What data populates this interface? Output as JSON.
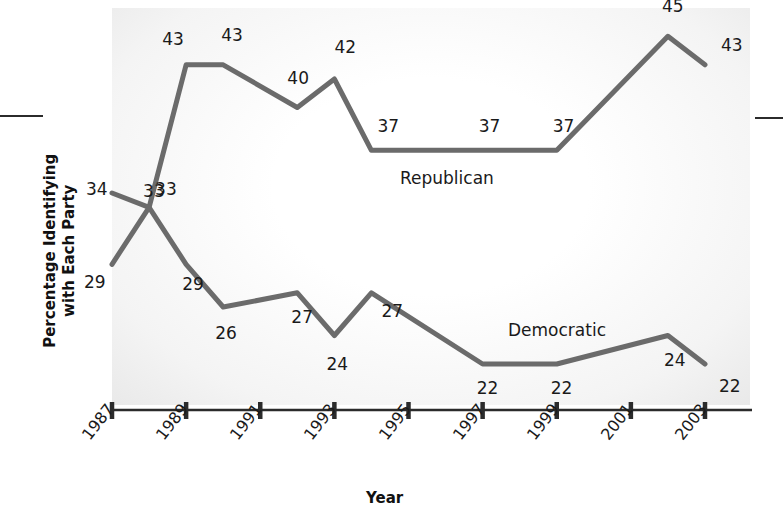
{
  "chart_data": {
    "type": "line",
    "title": "",
    "xlabel": "Year",
    "ylabel": "Percentage Identifying\nwith Each Party",
    "x": [
      1987,
      1988,
      1989,
      1990,
      1992,
      1993,
      1994,
      1997,
      1999,
      2002,
      2003
    ],
    "xtick_labels": [
      "1987",
      "1989",
      "1991",
      "1993",
      "1995",
      "1997",
      "1999",
      "2001",
      "2003"
    ],
    "xlim": [
      1987,
      2003.7
    ],
    "ylim": [
      18,
      48
    ],
    "grid": false,
    "legend_position": "inline-annotations",
    "series": [
      {
        "name": "Republican",
        "color": "#6b6b6b",
        "points": [
          {
            "x": 1987,
            "y": 34,
            "label": "34"
          },
          {
            "x": 1988,
            "y": 33,
            "label": "33"
          },
          {
            "x": 1989,
            "y": 43,
            "label": "43"
          },
          {
            "x": 1990,
            "y": 43,
            "label": "43"
          },
          {
            "x": 1992,
            "y": 40,
            "label": "40"
          },
          {
            "x": 1993,
            "y": 42,
            "label": "42"
          },
          {
            "x": 1994,
            "y": 37,
            "label": "37"
          },
          {
            "x": 1997,
            "y": 37,
            "label": "37"
          },
          {
            "x": 1999,
            "y": 37,
            "label": "37"
          },
          {
            "x": 2002,
            "y": 45,
            "label": "45"
          },
          {
            "x": 2003,
            "y": 43,
            "label": "43"
          }
        ]
      },
      {
        "name": "Democratic",
        "color": "#6b6b6b",
        "points": [
          {
            "x": 1987,
            "y": 29,
            "label": "29"
          },
          {
            "x": 1988,
            "y": 33,
            "label": "33"
          },
          {
            "x": 1989,
            "y": 29,
            "label": "29"
          },
          {
            "x": 1990,
            "y": 26,
            "label": "26"
          },
          {
            "x": 1992,
            "y": 27,
            "label": "27"
          },
          {
            "x": 1993,
            "y": 24,
            "label": "24"
          },
          {
            "x": 1994,
            "y": 27,
            "label": "27"
          },
          {
            "x": 1997,
            "y": 22,
            "label": "22"
          },
          {
            "x": 1999,
            "y": 22,
            "label": "22"
          },
          {
            "x": 2002,
            "y": 24,
            "label": "24"
          },
          {
            "x": 2003,
            "y": 22,
            "label": "22"
          }
        ]
      }
    ]
  },
  "annotations": {
    "republican_label": "Republican",
    "democratic_label": "Democratic"
  },
  "axes": {
    "x_title": "Year",
    "y_title": "Percentage Identifying\nwith Each Party",
    "tick_labels": [
      "1987",
      "1989",
      "1991",
      "1993",
      "1995",
      "1997",
      "1999",
      "2001",
      "2003"
    ]
  },
  "value_labels": {
    "republican": [
      "34",
      "33",
      "43",
      "43",
      "40",
      "42",
      "37",
      "37",
      "37",
      "45",
      "43"
    ],
    "democratic": [
      "29",
      "33",
      "29",
      "26",
      "27",
      "24",
      "27",
      "22",
      "22",
      "24",
      "22"
    ]
  },
  "colors": {
    "line": "#6b6b6b",
    "axis": "#2b2b2b",
    "text": "#1a1a1a",
    "plot_background": "#f4f4f4"
  }
}
